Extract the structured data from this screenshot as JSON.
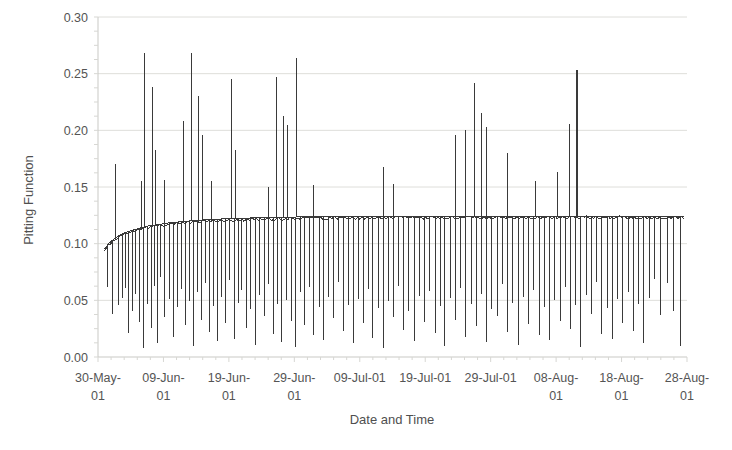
{
  "chart_data": {
    "type": "line",
    "title": "",
    "xlabel": "Date and Time",
    "ylabel": "Pitting Function",
    "ylim": [
      0.0,
      0.3
    ],
    "ytick_labels": [
      "0.00",
      "0.05",
      "0.10",
      "0.15",
      "0.20",
      "0.25",
      "0.30"
    ],
    "ytick_values": [
      0.0,
      0.05,
      0.1,
      0.15,
      0.2,
      0.25,
      0.3
    ],
    "xtick_labels": [
      "30-May-01",
      "09-Jun-01",
      "19-Jun-01",
      "29-Jun-01",
      "09-Jul-01",
      "19-Jul-01",
      "29-Jul-01",
      "08-Aug-01",
      "18-Aug-01",
      "28-Aug-01"
    ],
    "xlim_days": [
      0,
      90
    ],
    "xtick_days": [
      0,
      10,
      20,
      30,
      40,
      50,
      60,
      70,
      80,
      90
    ],
    "grid": true,
    "legend": "none",
    "series_name": "Pitting Function",
    "series_color": "#3a3a3a",
    "baseline_note": "Envelope rises from 0.095 at 30-May-01 and asymptotes near 0.124",
    "baseline": [
      [
        1.0,
        0.095
      ],
      [
        1.6,
        0.1
      ],
      [
        2.4,
        0.104
      ],
      [
        3.2,
        0.107
      ],
      [
        4.2,
        0.11
      ],
      [
        5.4,
        0.112
      ],
      [
        6.6,
        0.114
      ],
      [
        8.0,
        0.116
      ],
      [
        9.5,
        0.117
      ],
      [
        11.0,
        0.1185
      ],
      [
        13.0,
        0.1195
      ],
      [
        15.0,
        0.1205
      ],
      [
        17.0,
        0.1212
      ],
      [
        19.0,
        0.1218
      ],
      [
        21.0,
        0.1222
      ],
      [
        24.0,
        0.1228
      ],
      [
        27.0,
        0.1232
      ],
      [
        30.0,
        0.1235
      ],
      [
        34.0,
        0.1238
      ],
      [
        38.0,
        0.124
      ],
      [
        43.0,
        0.1241
      ],
      [
        48.0,
        0.1242
      ],
      [
        54.0,
        0.1243
      ],
      [
        60.0,
        0.1243
      ],
      [
        66.0,
        0.1244
      ],
      [
        72.0,
        0.1244
      ],
      [
        78.0,
        0.1244
      ],
      [
        84.0,
        0.1244
      ],
      [
        89.5,
        0.1244
      ]
    ],
    "up_spikes": [
      [
        2.6,
        0.17
      ],
      [
        4.2,
        0.061
      ],
      [
        6.6,
        0.155
      ],
      [
        7.1,
        0.268
      ],
      [
        8.3,
        0.238
      ],
      [
        8.8,
        0.183
      ],
      [
        10.1,
        0.156
      ],
      [
        13.0,
        0.208
      ],
      [
        14.3,
        0.268
      ],
      [
        15.4,
        0.23
      ],
      [
        15.9,
        0.196
      ],
      [
        17.3,
        0.155
      ],
      [
        20.4,
        0.245
      ],
      [
        21.0,
        0.183
      ],
      [
        26.0,
        0.15
      ],
      [
        27.3,
        0.247
      ],
      [
        28.4,
        0.213
      ],
      [
        29.0,
        0.205
      ],
      [
        30.3,
        0.264
      ],
      [
        33.0,
        0.152
      ],
      [
        43.6,
        0.168
      ],
      [
        45.1,
        0.153
      ],
      [
        54.6,
        0.196
      ],
      [
        56.2,
        0.2
      ],
      [
        57.6,
        0.242
      ],
      [
        58.6,
        0.215
      ],
      [
        59.4,
        0.203
      ],
      [
        62.6,
        0.18
      ],
      [
        66.9,
        0.155
      ],
      [
        70.2,
        0.163
      ],
      [
        72.0,
        0.206
      ],
      [
        73.1,
        0.253
      ],
      [
        73.1,
        0.225
      ]
    ],
    "down_spikes": [
      [
        1.4,
        0.062
      ],
      [
        2.2,
        0.038
      ],
      [
        3.1,
        0.046
      ],
      [
        3.8,
        0.052
      ],
      [
        4.6,
        0.021
      ],
      [
        5.2,
        0.041
      ],
      [
        5.8,
        0.056
      ],
      [
        6.4,
        0.031
      ],
      [
        7.0,
        0.008
      ],
      [
        7.6,
        0.047
      ],
      [
        8.1,
        0.026
      ],
      [
        8.6,
        0.063
      ],
      [
        9.1,
        0.012
      ],
      [
        9.6,
        0.071
      ],
      [
        10.2,
        0.035
      ],
      [
        10.9,
        0.051
      ],
      [
        11.5,
        0.018
      ],
      [
        12.2,
        0.044
      ],
      [
        12.8,
        0.06
      ],
      [
        13.4,
        0.028
      ],
      [
        14.0,
        0.049
      ],
      [
        14.6,
        0.01
      ],
      [
        15.2,
        0.057
      ],
      [
        15.8,
        0.033
      ],
      [
        16.4,
        0.065
      ],
      [
        17.0,
        0.022
      ],
      [
        17.6,
        0.045
      ],
      [
        18.3,
        0.014
      ],
      [
        18.9,
        0.053
      ],
      [
        19.5,
        0.03
      ],
      [
        20.1,
        0.068
      ],
      [
        20.8,
        0.016
      ],
      [
        21.4,
        0.048
      ],
      [
        22.0,
        0.059
      ],
      [
        22.7,
        0.026
      ],
      [
        23.3,
        0.042
      ],
      [
        24.0,
        0.011
      ],
      [
        24.7,
        0.055
      ],
      [
        25.4,
        0.036
      ],
      [
        26.1,
        0.064
      ],
      [
        26.8,
        0.02
      ],
      [
        27.5,
        0.047
      ],
      [
        28.1,
        0.013
      ],
      [
        28.8,
        0.05
      ],
      [
        29.5,
        0.032
      ],
      [
        30.2,
        0.009
      ],
      [
        30.9,
        0.057
      ],
      [
        31.6,
        0.028
      ],
      [
        32.3,
        0.062
      ],
      [
        33.0,
        0.019
      ],
      [
        33.8,
        0.044
      ],
      [
        34.5,
        0.015
      ],
      [
        35.2,
        0.053
      ],
      [
        36.0,
        0.034
      ],
      [
        36.8,
        0.066
      ],
      [
        37.5,
        0.023
      ],
      [
        38.2,
        0.046
      ],
      [
        39.0,
        0.012
      ],
      [
        39.8,
        0.051
      ],
      [
        40.5,
        0.03
      ],
      [
        41.3,
        0.06
      ],
      [
        42.0,
        0.017
      ],
      [
        42.8,
        0.043
      ],
      [
        43.6,
        0.008
      ],
      [
        44.4,
        0.049
      ],
      [
        45.1,
        0.035
      ],
      [
        45.9,
        0.063
      ],
      [
        46.7,
        0.024
      ],
      [
        47.5,
        0.041
      ],
      [
        48.3,
        0.014
      ],
      [
        49.1,
        0.054
      ],
      [
        49.9,
        0.031
      ],
      [
        50.7,
        0.058
      ],
      [
        51.5,
        0.021
      ],
      [
        52.3,
        0.045
      ],
      [
        53.0,
        0.01
      ],
      [
        53.8,
        0.052
      ],
      [
        54.6,
        0.033
      ],
      [
        55.4,
        0.061
      ],
      [
        56.2,
        0.018
      ],
      [
        57.0,
        0.047
      ],
      [
        57.8,
        0.027
      ],
      [
        58.6,
        0.056
      ],
      [
        59.4,
        0.013
      ],
      [
        60.2,
        0.042
      ],
      [
        61.0,
        0.036
      ],
      [
        61.8,
        0.064
      ],
      [
        62.6,
        0.022
      ],
      [
        63.4,
        0.048
      ],
      [
        64.2,
        0.011
      ],
      [
        65.0,
        0.053
      ],
      [
        65.8,
        0.029
      ],
      [
        66.6,
        0.059
      ],
      [
        67.4,
        0.019
      ],
      [
        68.2,
        0.044
      ],
      [
        69.0,
        0.015
      ],
      [
        69.8,
        0.05
      ],
      [
        70.6,
        0.032
      ],
      [
        71.4,
        0.062
      ],
      [
        72.2,
        0.025
      ],
      [
        73.0,
        0.046
      ],
      [
        73.8,
        0.009
      ],
      [
        74.6,
        0.055
      ],
      [
        75.4,
        0.038
      ],
      [
        76.2,
        0.066
      ],
      [
        77.0,
        0.02
      ],
      [
        77.8,
        0.043
      ],
      [
        78.6,
        0.016
      ],
      [
        79.4,
        0.051
      ],
      [
        80.2,
        0.03
      ],
      [
        81.0,
        0.057
      ],
      [
        81.8,
        0.023
      ],
      [
        82.6,
        0.047
      ],
      [
        83.4,
        0.012
      ],
      [
        84.2,
        0.052
      ],
      [
        85.0,
        0.069
      ],
      [
        86.0,
        0.037
      ],
      [
        87.0,
        0.065
      ],
      [
        88.0,
        0.041
      ],
      [
        89.0,
        0.01
      ]
    ]
  },
  "axes": {
    "y_title": "Pitting Function",
    "x_title": "Date and Time"
  }
}
